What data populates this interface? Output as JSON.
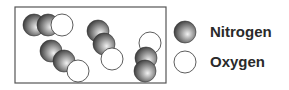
{
  "legend": {
    "items": [
      {
        "label": "Nitrogen",
        "type": "nitrogen"
      },
      {
        "label": "Oxygen",
        "type": "oxygen"
      }
    ]
  },
  "molecules": [
    {
      "atoms": [
        "N",
        "N",
        "O"
      ]
    },
    {
      "atoms": [
        "N",
        "N",
        "O"
      ]
    },
    {
      "atoms": [
        "N",
        "N",
        "O"
      ]
    },
    {
      "atoms": [
        "O",
        "N",
        "N"
      ]
    }
  ],
  "colors": {
    "border": "#555555",
    "nitrogen_light": "#f0f0f0",
    "nitrogen_dark": "#3a3a3a",
    "oxygen_fill": "#ffffff",
    "stroke": "#333333"
  }
}
